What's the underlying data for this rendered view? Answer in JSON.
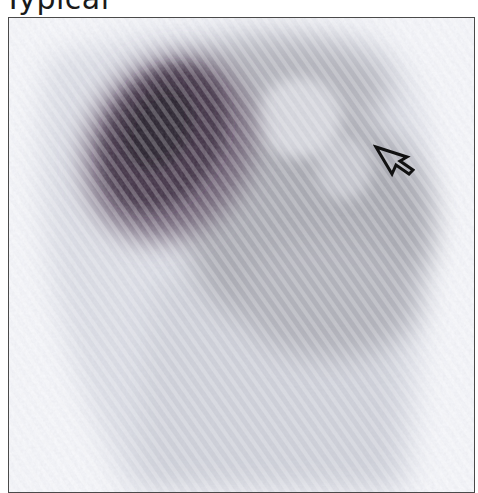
{
  "figure": {
    "label": "Typical",
    "image_type": "scintigraphy-scan",
    "annotation": {
      "type": "open-arrow",
      "direction": "up-left",
      "color": "#111111"
    }
  },
  "colors": {
    "background": "#ffffff",
    "frame_border": "#4a4a4a",
    "uptake_dark": "#2a1e2e",
    "uptake_mid": "#9a9aa2",
    "uptake_light": "#d2d4dc",
    "field": "#f6f7fb"
  }
}
